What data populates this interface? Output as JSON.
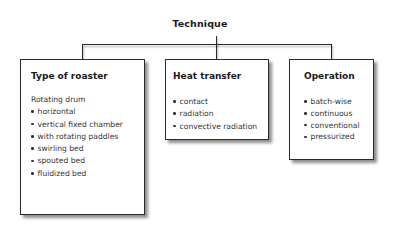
{
  "diagram": {
    "root": {
      "label": "Technique"
    },
    "nodes": [
      {
        "title": "Type of roaster",
        "subheading": "Rotating drum",
        "items": [
          "horizontal",
          "vertical fixed chamber",
          "with rotating paddles",
          "swirling bed",
          "spouted bed",
          "fluidized bed"
        ]
      },
      {
        "title": "Heat transfer",
        "items": [
          "contact",
          "radiation",
          "convective radiation"
        ]
      },
      {
        "title": "Operation",
        "items": [
          "batch-wise",
          "continuous",
          "conventional",
          "pressurized"
        ]
      }
    ],
    "colors": {
      "line": "#2a2a2a",
      "text": "#333333",
      "background": "#ffffff"
    }
  }
}
